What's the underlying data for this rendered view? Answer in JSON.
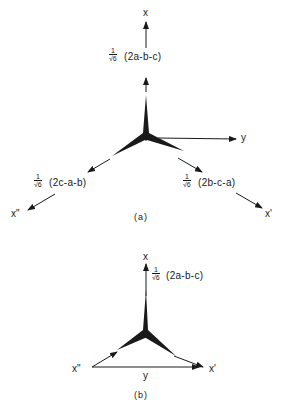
{
  "panel_a": {
    "caption": "(a)",
    "axis_x": "x",
    "axis_y": "y",
    "axis_x_prime": "x'",
    "axis_x_double_prime": "x\"",
    "frac_num": "1",
    "frac_den": "√6",
    "expr_top": "(2a-b-c)",
    "expr_right": "(2b-c-a)",
    "expr_left": "(2c-a-b)"
  },
  "panel_b": {
    "caption": "(b)",
    "axis_x": "x",
    "axis_y": "y",
    "axis_x_prime": "x'",
    "axis_x_double_prime": "x\"",
    "frac_num": "1",
    "frac_den": "√6",
    "expr_top": "(2a-b-c)"
  }
}
